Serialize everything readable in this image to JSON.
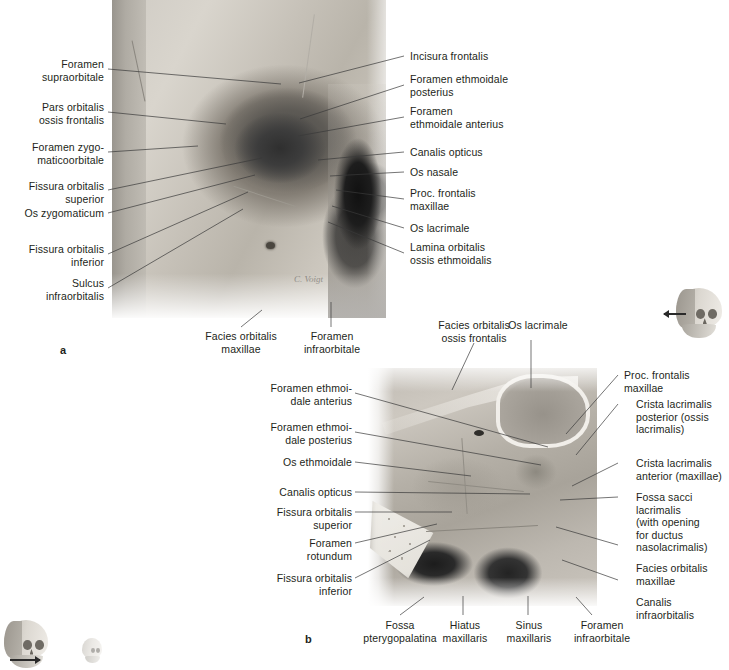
{
  "figure": {
    "panel_a": {
      "letter": "a",
      "labels_left": [
        {
          "id": "foramen-supraorbitale",
          "text": "Foramen\nsupraorbitale"
        },
        {
          "id": "pars-orbitalis-ossis-frontalis",
          "text": "Pars orbitalis\nossis frontalis"
        },
        {
          "id": "foramen-zygomaticoorbitale",
          "text": "Foramen zygo-\nmaticoorbitale"
        },
        {
          "id": "fissura-orbitalis-superior",
          "text": "Fissura orbitalis\nsuperior"
        },
        {
          "id": "os-zygomaticum",
          "text": "Os zygomaticum"
        },
        {
          "id": "fissura-orbitalis-inferior",
          "text": "Fissura orbitalis\ninferior"
        },
        {
          "id": "sulcus-infraorbitalis",
          "text": "Sulcus\ninfraorbitalis"
        }
      ],
      "labels_right": [
        {
          "id": "incisura-frontalis",
          "text": "Incisura frontalis"
        },
        {
          "id": "foramen-ethmoidale-posterius",
          "text": "Foramen ethmoidale\nposterius"
        },
        {
          "id": "foramen-ethmoidale-anterius",
          "text": "Foramen\nethmoidale anterius"
        },
        {
          "id": "canalis-opticus",
          "text": "Canalis opticus"
        },
        {
          "id": "os-nasale",
          "text": "Os nasale"
        },
        {
          "id": "proc-frontalis-maxillae",
          "text": "Proc. frontalis\nmaxillae"
        },
        {
          "id": "os-lacrimale",
          "text": "Os lacrimale"
        },
        {
          "id": "lamina-orbitalis-ossis-ethmoidalis",
          "text": "Lamina orbitalis\nossis ethmoidalis"
        }
      ],
      "labels_bottom": [
        {
          "id": "facies-orbitalis-maxillae",
          "text": "Facies orbitalis\nmaxillae"
        },
        {
          "id": "foramen-infraorbitale",
          "text": "Foramen\ninfraorbitale"
        }
      ],
      "artist_signature": "C. Voigt"
    },
    "panel_b": {
      "letter": "b",
      "labels_top": [
        {
          "id": "facies-orbitalis-ossis-frontalis",
          "text": "Facies orbitalis\nossis frontalis"
        },
        {
          "id": "os-lacrimale-top",
          "text": "Os lacrimale"
        }
      ],
      "labels_left": [
        {
          "id": "foramen-ethmoidale-anterius-b",
          "text": "Foramen ethmoi-\ndale anterius"
        },
        {
          "id": "foramen-ethmoidale-posterius-b",
          "text": "Foramen ethmoi-\ndale posterius"
        },
        {
          "id": "os-ethmoidale",
          "text": "Os ethmoidale"
        },
        {
          "id": "canalis-opticus-b",
          "text": "Canalis opticus"
        },
        {
          "id": "fissura-orbitalis-superior-b",
          "text": "Fissura orbitalis\nsuperior"
        },
        {
          "id": "foramen-rotundum",
          "text": "Foramen\nrotundum"
        },
        {
          "id": "fissura-orbitalis-inferior-b",
          "text": "Fissura orbitalis\ninferior"
        }
      ],
      "labels_right": [
        {
          "id": "proc-frontalis-maxillae-b",
          "text": "Proc. frontalis\nmaxillae"
        },
        {
          "id": "crista-lacrimalis-posterior",
          "text": "Crista lacrimalis\nposterior (ossis\nlacrimalis)"
        },
        {
          "id": "crista-lacrimalis-anterior",
          "text": "Crista lacrimalis\nanterior (maxillae)"
        },
        {
          "id": "fossa-sacci-lacrimalis",
          "text": "Fossa sacci\nlacrimalis\n(with opening\nfor ductus\nnasolacrimalis)"
        },
        {
          "id": "facies-orbitalis-maxillae-b",
          "text": "Facies orbitalis\nmaxillae"
        },
        {
          "id": "canalis-infraorbitalis",
          "text": "Canalis\ninfraorbitalis"
        }
      ],
      "labels_bottom": [
        {
          "id": "fossa-pterygopalatina",
          "text": "Fossa\npterygopalatina"
        },
        {
          "id": "hiatus-maxillaris",
          "text": "Hiatus\nmaxillaris"
        },
        {
          "id": "sinus-maxillaris",
          "text": "Sinus\nmaxillaris"
        },
        {
          "id": "foramen-infraorbitale-b",
          "text": "Foramen\ninfraorbitale"
        }
      ]
    },
    "thumbnails": [
      {
        "id": "orientation-skull-panel-b",
        "name": "skull-orientation-icon"
      },
      {
        "id": "orientation-skull-bottom-left",
        "name": "skull-orientation-icon"
      },
      {
        "id": "orientation-skull-bottom-small",
        "name": "skull-orientation-icon"
      }
    ]
  },
  "colors": {
    "text": "#231f20",
    "leader": "#3a3a3a",
    "background": "#ffffff"
  }
}
